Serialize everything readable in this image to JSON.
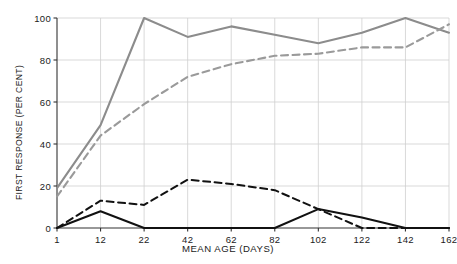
{
  "chart_data": {
    "type": "line",
    "title": "",
    "xlabel": "MEAN AGE (DAYS)",
    "ylabel": "FIRST RESPONSE (PER CENT)",
    "x": [
      1,
      12,
      22,
      42,
      62,
      82,
      102,
      122,
      142,
      162
    ],
    "xtick_labels": [
      "1",
      "12",
      "22",
      "42",
      "62",
      "82",
      "102",
      "122",
      "142",
      "162"
    ],
    "ytick_labels": [
      "0",
      "20",
      "40",
      "60",
      "80",
      "100"
    ],
    "yticks": [
      0,
      20,
      40,
      60,
      80,
      100
    ],
    "ylim": [
      0,
      100
    ],
    "grid": true,
    "legend": "none",
    "series": [
      {
        "name": "grey-solid",
        "style": "solid",
        "color": "#8c8c8c",
        "values": [
          19,
          49,
          100,
          91,
          96,
          92,
          88,
          93,
          100,
          93
        ]
      },
      {
        "name": "grey-dashed",
        "style": "dashed",
        "color": "#9a9a9a",
        "values": [
          15,
          44,
          59,
          72,
          78,
          82,
          83,
          86,
          86,
          97
        ]
      },
      {
        "name": "black-dashed",
        "style": "dashed",
        "color": "#111111",
        "values": [
          0,
          13,
          11,
          23,
          21,
          18,
          9,
          0,
          0,
          0
        ]
      },
      {
        "name": "black-solid",
        "style": "solid",
        "color": "#111111",
        "values": [
          0,
          8,
          0,
          0,
          0,
          0,
          9,
          5,
          0,
          0
        ]
      }
    ]
  },
  "axis_titles": {
    "y": "FIRST RESPONSE (PER CENT)",
    "x": "MEAN AGE (DAYS)"
  },
  "colors": {
    "grid": "#cfcfcf",
    "axis": "#333333",
    "grey_series": "#8c8c8c",
    "black_series": "#111111"
  }
}
